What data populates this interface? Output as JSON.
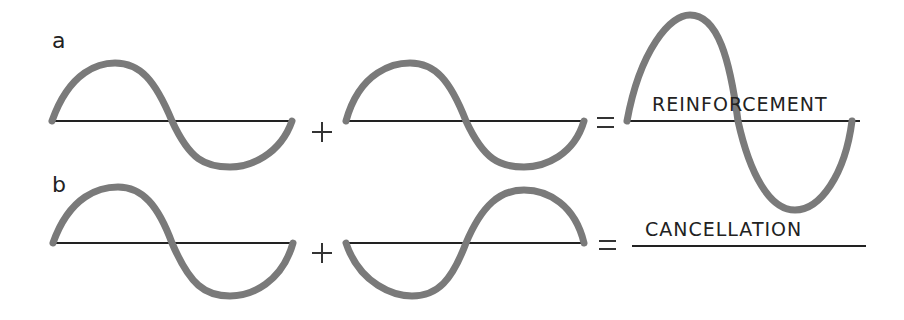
{
  "diagram": {
    "rows": [
      {
        "label": "a",
        "operator_plus": "+",
        "operator_equals": "=",
        "result_caption": "REINFORCEMENT",
        "description": "Two in-phase waves add to a wave of double amplitude"
      },
      {
        "label": "b",
        "operator_plus": "+",
        "operator_equals": "=",
        "result_caption": "CANCELLATION",
        "description": "Two out-of-phase waves cancel to a flat line"
      }
    ],
    "colors": {
      "wave": "#7a7a7a",
      "axis": "#222222",
      "background": "#ffffff"
    }
  }
}
